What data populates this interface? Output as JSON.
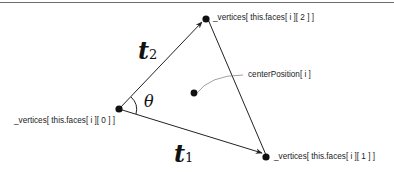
{
  "diagram": {
    "labels": {
      "v0": "_vertices[ this.faces[ i ][ 0 ] ]",
      "v1": "_vertices[ this.faces[ i ][ 1 ] ]",
      "v2": "_vertices[ this.faces[ i ][ 2 ] ]",
      "center": "centerPosition[ i ]"
    },
    "math": {
      "t1": "t",
      "t1_sub": "1",
      "t2": "t",
      "t2_sub": "2",
      "theta": "θ"
    }
  }
}
